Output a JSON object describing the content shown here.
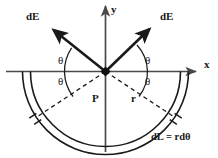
{
  "figure": {
    "background_color": "#ffffff",
    "stroke_color": "#1a1a1a",
    "axes": {
      "x_label": "x",
      "y_label": "y",
      "origin_marker": "filled-square-point"
    },
    "vectors": [
      {
        "label": "dE",
        "side": "left",
        "direction_deg": 140
      },
      {
        "label": "dE",
        "side": "right",
        "direction_deg": 52
      }
    ],
    "angles": [
      {
        "label": "θ",
        "position": "upper-left"
      },
      {
        "label": "θ",
        "position": "lower-left"
      },
      {
        "label": "θ",
        "position": "upper-right"
      },
      {
        "label": "θ",
        "position": "lower-right"
      }
    ],
    "points": [
      {
        "label": "P",
        "description": "field point at center of semicircle"
      }
    ],
    "radii": [
      {
        "label": "r",
        "description": "radius of semicircular rod"
      }
    ],
    "element": {
      "label": "dL = rdθ",
      "description": "differential arc length element of the charged rod"
    },
    "ring": {
      "shape": "semicircular-band",
      "position": "below-x-axis",
      "segment_markers": 2
    }
  }
}
